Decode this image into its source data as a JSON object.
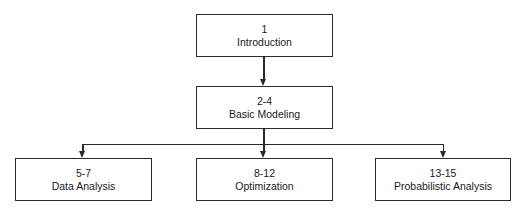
{
  "diagram": {
    "type": "hierarchy",
    "nodes": [
      {
        "id": "intro",
        "chapters": "1",
        "title": "Introduction"
      },
      {
        "id": "basic",
        "chapters": "2-4",
        "title": "Basic Modeling"
      },
      {
        "id": "data",
        "chapters": "5-7",
        "title": "Data Analysis"
      },
      {
        "id": "opt",
        "chapters": "8-12",
        "title": "Optimization"
      },
      {
        "id": "prob",
        "chapters": "13-15",
        "title": "Probabilistic Analysis"
      }
    ],
    "edges": [
      {
        "from": "intro",
        "to": "basic"
      },
      {
        "from": "basic",
        "to": "data"
      },
      {
        "from": "basic",
        "to": "opt"
      },
      {
        "from": "basic",
        "to": "prob"
      }
    ],
    "colors": {
      "stroke": "#2a2a2a",
      "background": "#ffffff"
    }
  }
}
